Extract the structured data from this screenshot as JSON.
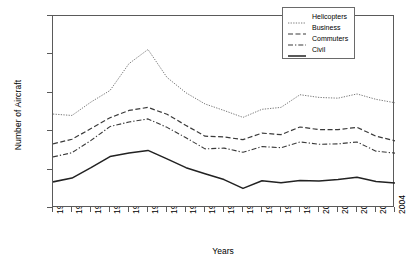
{
  "chart_data": {
    "type": "line",
    "title": "",
    "xlabel": "Years",
    "ylabel": "Number of Aircraft",
    "xlim": [
      1986,
      2004
    ],
    "ylim": [
      0,
      2500
    ],
    "ytick_values": [
      0,
      500,
      1000,
      1500,
      2000,
      2500
    ],
    "ytick_labels": [
      "0",
      "500",
      "1000",
      "1500",
      "2000",
      "2500"
    ],
    "grid": false,
    "legend_position": "top-right inside plot",
    "categories": [
      "1986",
      "1987",
      "1988",
      "1989",
      "1990",
      "1991",
      "1992",
      "1993",
      "1994",
      "1995",
      "1996",
      "1997",
      "1998",
      "1999",
      "2000",
      "2001",
      "2002",
      "2003",
      "2004"
    ],
    "series": [
      {
        "name": "Helicopters",
        "style": "dotted",
        "color": "#6b6b6b",
        "values": [
          1223,
          1205,
          1380,
          1530,
          1880,
          2064,
          1700,
          1500,
          1355,
          1270,
          1180,
          1285,
          1310,
          1475,
          1440,
          1430,
          1485,
          1415,
          1370
        ]
      },
      {
        "name": "Business",
        "style": "dashed",
        "color": "#3a3a3a",
        "values": [
          835,
          895,
          1035,
          1175,
          1270,
          1310,
          1220,
          1075,
          935,
          925,
          890,
          975,
          955,
          1055,
          1020,
          1020,
          1050,
          935,
          875
        ]
      },
      {
        "name": "Commuters",
        "style": "dash-dot",
        "color": "#3a3a3a",
        "values": [
          665,
          720,
          880,
          1060,
          1120,
          1160,
          1050,
          915,
          770,
          780,
          725,
          800,
          785,
          860,
          830,
          835,
          860,
          740,
          715
        ]
      },
      {
        "name": "Civil",
        "style": "solid",
        "color": "#222222",
        "values": [
          340,
          390,
          525,
          670,
          715,
          750,
          640,
          525,
          445,
          370,
          255,
          355,
          330,
          358,
          352,
          370,
          400,
          345,
          325
        ]
      }
    ]
  },
  "legend": {
    "items": [
      {
        "label": "Helicopters"
      },
      {
        "label": "Business"
      },
      {
        "label": "Commuters"
      },
      {
        "label": "Civil"
      }
    ]
  }
}
